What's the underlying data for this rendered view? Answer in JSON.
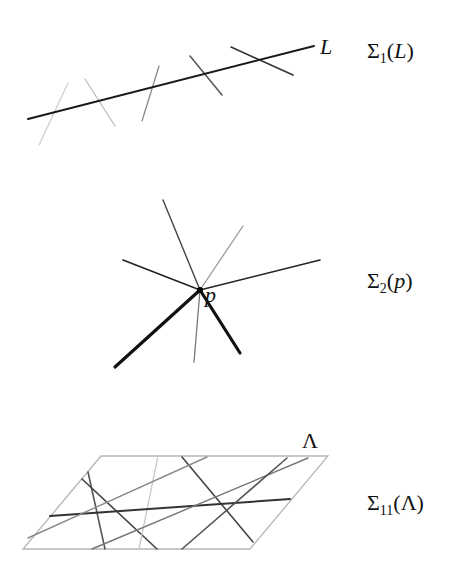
{
  "panels": [
    {
      "id": "sigma1",
      "label": {
        "sigma": "Σ",
        "sub": "1",
        "open": "(",
        "arg": "L",
        "close": ")"
      },
      "inline_label": "L",
      "main_line": {
        "x1": 28,
        "y1": 119,
        "x2": 314,
        "y2": 46,
        "color": "#1a1a1a",
        "width": 2
      },
      "lines": [
        {
          "x1": 68,
          "y1": 83,
          "x2": 39,
          "y2": 145,
          "color": "#cfcfcf",
          "width": 1.3
        },
        {
          "x1": 85,
          "y1": 79,
          "x2": 115,
          "y2": 126,
          "color": "#bdbdbd",
          "width": 1.3
        },
        {
          "x1": 159,
          "y1": 66,
          "x2": 142,
          "y2": 121,
          "color": "#8a8a8a",
          "width": 1.3
        },
        {
          "x1": 190,
          "y1": 56,
          "x2": 222,
          "y2": 95,
          "color": "#555555",
          "width": 1.5
        },
        {
          "x1": 231,
          "y1": 47,
          "x2": 293,
          "y2": 75,
          "color": "#333333",
          "width": 1.6
        }
      ]
    },
    {
      "id": "sigma2",
      "label": {
        "sigma": "Σ",
        "sub": "2",
        "open": "(",
        "arg": "p",
        "close": ")"
      },
      "inline_label": "p",
      "center": {
        "x": 200,
        "y": 290
      },
      "rays": [
        {
          "x": 163,
          "y": 200,
          "color": "#444444",
          "width": 1.4
        },
        {
          "x": 243,
          "y": 226,
          "color": "#9a9a9a",
          "width": 1.3
        },
        {
          "x": 123,
          "y": 260,
          "color": "#222222",
          "width": 1.6
        },
        {
          "x": 320,
          "y": 260,
          "color": "#222222",
          "width": 1.6
        },
        {
          "x": 115,
          "y": 367,
          "color": "#111111",
          "width": 3.2
        },
        {
          "x": 240,
          "y": 353,
          "color": "#111111",
          "width": 3.2
        },
        {
          "x": 194,
          "y": 362,
          "color": "#777777",
          "width": 1.3
        }
      ]
    },
    {
      "id": "sigma11",
      "label": {
        "sigma": "Σ",
        "sub": "11",
        "open": "(",
        "arg": "Λ",
        "close": ")"
      },
      "inline_label": "Λ",
      "plane": {
        "points": "101,456 328,456 250,549 23,549",
        "color": "#b5b5b5"
      },
      "lines": [
        {
          "x1": 88,
          "y1": 472,
          "x2": 105,
          "y2": 549,
          "color": "#555555",
          "width": 1.6
        },
        {
          "x1": 82,
          "y1": 479,
          "x2": 157,
          "y2": 549,
          "color": "#444444",
          "width": 1.6
        },
        {
          "x1": 158,
          "y1": 456,
          "x2": 139,
          "y2": 549,
          "color": "#c8c8c8",
          "width": 1.3
        },
        {
          "x1": 182,
          "y1": 457,
          "x2": 253,
          "y2": 542,
          "color": "#444444",
          "width": 1.6
        },
        {
          "x1": 50,
          "y1": 516,
          "x2": 290,
          "y2": 499,
          "color": "#333333",
          "width": 2
        },
        {
          "x1": 28,
          "y1": 538,
          "x2": 207,
          "y2": 457,
          "color": "#8a8a8a",
          "width": 1.4
        },
        {
          "x1": 92,
          "y1": 549,
          "x2": 308,
          "y2": 458,
          "color": "#777777",
          "width": 1.4
        },
        {
          "x1": 182,
          "y1": 549,
          "x2": 287,
          "y2": 458,
          "color": "#555555",
          "width": 1.6
        }
      ]
    }
  ]
}
